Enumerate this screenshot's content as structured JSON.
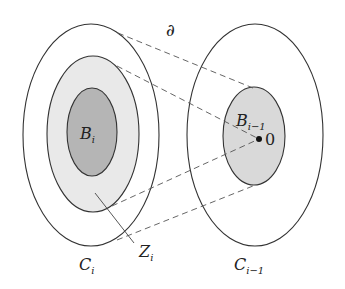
{
  "diagram": {
    "title": "",
    "labels": {
      "boundary": "∂",
      "left_outer": "C",
      "left_outer_sub": "i",
      "left_inner": "B",
      "left_inner_sub": "i",
      "annulus": "Z",
      "annulus_sub": "i",
      "right_outer": "C",
      "right_outer_sub": "i−1",
      "right_inner": "B",
      "right_inner_sub": "i−1",
      "origin": "0"
    },
    "colors": {
      "stroke": "#333333",
      "dash": "#555555",
      "inner_fill": "#b5b5b5",
      "ring_fill": "#e9e9e9",
      "right_inner_fill": "#d9d9d9",
      "background": "#ffffff"
    },
    "shapes": {
      "left_outer": {
        "cx": 91,
        "cy": 135,
        "rx": 68,
        "ry": 111
      },
      "left_middle": {
        "cx": 93,
        "cy": 134,
        "rx": 46,
        "ry": 78
      },
      "left_inner": {
        "cx": 92,
        "cy": 132,
        "rx": 25,
        "ry": 44
      },
      "right_outer": {
        "cx": 255,
        "cy": 135,
        "rx": 68,
        "ry": 111
      },
      "right_inner": {
        "cx": 254,
        "cy": 136,
        "rx": 31,
        "ry": 49
      },
      "origin_point": {
        "cx": 259,
        "cy": 139,
        "r": 3
      }
    }
  }
}
